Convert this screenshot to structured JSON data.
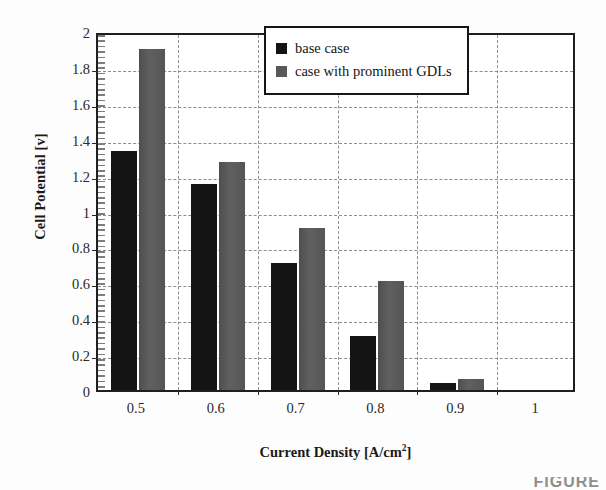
{
  "chart_data": {
    "type": "bar",
    "title": "",
    "xlabel": "Current Density [A/cm²]",
    "ylabel": "Cell Potential [v]",
    "categories": [
      "0.5",
      "0.6",
      "0.7",
      "0.8",
      "0.9",
      "1"
    ],
    "series": [
      {
        "name": "base case",
        "color": "#141414",
        "values": [
          1.33,
          1.15,
          0.71,
          0.3,
          0.04,
          0
        ]
      },
      {
        "name": "case with prominent GDLs",
        "color": "#585858",
        "values": [
          1.9,
          1.27,
          0.9,
          0.61,
          0.06,
          0
        ]
      }
    ],
    "ylim": [
      0,
      2
    ],
    "ytick_labels": [
      "0",
      "0.2",
      "0.4",
      "0.6",
      "0.8",
      "1",
      "1.2",
      "1.4",
      "1.6",
      "1.8",
      "2"
    ],
    "ytick_values": [
      0,
      0.2,
      0.4,
      0.6,
      0.8,
      1,
      1.2,
      1.4,
      1.6,
      1.8,
      2
    ],
    "grid": true,
    "grid_style": "dashed",
    "legend_position": "top-right"
  },
  "axes": {
    "y_title": "Cell Potential [v]",
    "x_title_prefix": "Current Density [A/cm",
    "x_title_sup": "2",
    "x_title_suffix": "]"
  },
  "legend": {
    "entries": [
      {
        "label": "base case"
      },
      {
        "label": "case with prominent GDLs"
      }
    ]
  },
  "caption": {
    "fragment": "FIGURE"
  }
}
